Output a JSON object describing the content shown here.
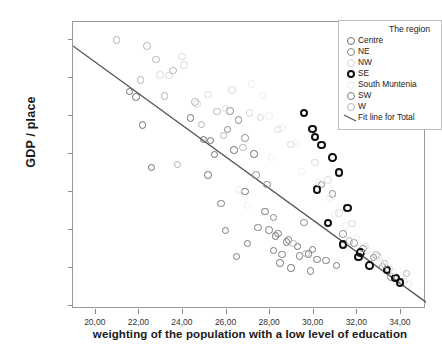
{
  "chart_data": {
    "type": "scatter",
    "title": "",
    "xlabel": "weighting of the population with a low level of education",
    "ylabel": "GDP / place",
    "xlim": [
      19.0,
      35.2
    ],
    "ylim": [
      900,
      8450
    ],
    "xticks": [
      "20,00",
      "22,00",
      "24,00",
      "26,00",
      "28,00",
      "30,00",
      "32,00",
      "34,00"
    ],
    "xtick_values": [
      20,
      22,
      24,
      26,
      28,
      30,
      32,
      34
    ],
    "yticks": [
      "1000,00",
      "2000,00",
      "3000,00",
      "4000,00",
      "5000,00",
      "6000,00",
      "7000,00",
      "8000,00"
    ],
    "ytick_values": [
      1000,
      2000,
      3000,
      4000,
      5000,
      6000,
      7000,
      8000
    ],
    "grid": false,
    "legend_position": "top-right",
    "legend_title": "The region",
    "fit_line": {
      "label": "Fit line for Total",
      "color": "#555555",
      "x_start": 19.0,
      "y_start": 7820,
      "x_end": 35.2,
      "y_end": 1080
    },
    "series": [
      {
        "name": "Centre",
        "color": "#6e6e6e",
        "marker": "open-circle",
        "points": [
          [
            21.6,
            6620
          ],
          [
            21.9,
            6480
          ],
          [
            22.2,
            5740
          ],
          [
            22.6,
            4620
          ],
          [
            24.4,
            5930
          ],
          [
            25.0,
            5360
          ],
          [
            25.3,
            5330
          ],
          [
            25.5,
            4960
          ],
          [
            25.2,
            4420
          ],
          [
            26.4,
            5080
          ],
          [
            27.3,
            4980
          ],
          [
            26.9,
            3990
          ],
          [
            27.8,
            3460
          ],
          [
            28.3,
            2820
          ],
          [
            28.8,
            2660
          ],
          [
            29.3,
            2540
          ],
          [
            29.8,
            2350
          ],
          [
            30.2,
            2200
          ],
          [
            28.5,
            2110
          ],
          [
            29.0,
            1980
          ]
        ]
      },
      {
        "name": "NE",
        "color": "#888888",
        "marker": "open-circle",
        "points": [
          [
            26.2,
            6110
          ],
          [
            26.6,
            5870
          ],
          [
            26.1,
            5620
          ],
          [
            26.9,
            5400
          ],
          [
            27.4,
            4420
          ],
          [
            27.9,
            4180
          ],
          [
            28.2,
            3310
          ],
          [
            29.6,
            3180
          ],
          [
            30.4,
            4170
          ],
          [
            30.9,
            3930
          ],
          [
            31.4,
            2870
          ],
          [
            31.9,
            2630
          ],
          [
            32.3,
            2490
          ],
          [
            32.8,
            2260
          ],
          [
            33.2,
            2010
          ],
          [
            33.6,
            1740
          ]
        ]
      },
      {
        "name": "NW",
        "color": "#d8d8d8",
        "marker": "open-circle",
        "points": [
          [
            24.0,
            7540
          ],
          [
            24.1,
            7320
          ],
          [
            23.0,
            7050
          ],
          [
            23.4,
            7040
          ],
          [
            25.2,
            6540
          ],
          [
            24.7,
            6290
          ],
          [
            26.3,
            6660
          ],
          [
            26.0,
            6170
          ],
          [
            27.1,
            6060
          ],
          [
            27.6,
            5940
          ],
          [
            28.4,
            5620
          ],
          [
            29.0,
            5230
          ],
          [
            30.1,
            4760
          ],
          [
            30.7,
            4300
          ],
          [
            31.2,
            3420
          ],
          [
            31.8,
            3150
          ],
          [
            32.4,
            2540
          ],
          [
            33.0,
            2270
          ],
          [
            33.5,
            1950
          ],
          [
            34.2,
            1620
          ]
        ]
      },
      {
        "name": "SE",
        "color": "#111111",
        "marker": "bold-open-circle",
        "points": [
          [
            29.6,
            6060
          ],
          [
            30.0,
            5640
          ],
          [
            30.1,
            5430
          ],
          [
            30.4,
            5210
          ],
          [
            30.9,
            4890
          ],
          [
            31.2,
            4490
          ],
          [
            30.2,
            4050
          ],
          [
            31.6,
            3560
          ],
          [
            30.7,
            3160
          ],
          [
            31.4,
            2600
          ],
          [
            32.2,
            2390
          ],
          [
            32.1,
            2270
          ],
          [
            32.6,
            2050
          ],
          [
            33.4,
            1920
          ],
          [
            33.8,
            1720
          ],
          [
            34.0,
            1600
          ]
        ]
      },
      {
        "name": "South Muntenia",
        "color": "#ededed",
        "marker": "open-circle",
        "points": [
          [
            27.2,
            6820
          ],
          [
            27.7,
            6520
          ],
          [
            28.0,
            5980
          ],
          [
            28.6,
            5660
          ],
          [
            29.2,
            5280
          ],
          [
            28.1,
            4880
          ],
          [
            29.5,
            4520
          ],
          [
            30.3,
            4230
          ],
          [
            30.8,
            3820
          ],
          [
            31.0,
            3400
          ],
          [
            31.5,
            3090
          ],
          [
            32.0,
            2760
          ],
          [
            32.5,
            2440
          ],
          [
            33.1,
            2150
          ],
          [
            33.7,
            1880
          ],
          [
            34.4,
            1560
          ],
          [
            26.6,
            4050
          ],
          [
            27.0,
            3620
          ]
        ]
      },
      {
        "name": "SW",
        "color": "#7a7a7a",
        "marker": "open-circle",
        "points": [
          [
            27.5,
            3050
          ],
          [
            28.0,
            2980
          ],
          [
            28.4,
            2880
          ],
          [
            27.0,
            2620
          ],
          [
            28.9,
            2720
          ],
          [
            28.2,
            2440
          ],
          [
            28.6,
            2330
          ],
          [
            29.4,
            2290
          ],
          [
            30.0,
            2470
          ],
          [
            30.6,
            2180
          ],
          [
            26.5,
            2280
          ],
          [
            29.9,
            1900
          ],
          [
            31.1,
            2040
          ],
          [
            26.0,
            2960
          ],
          [
            25.8,
            3680
          ]
        ]
      },
      {
        "name": "W",
        "color": "#b4b4b4",
        "marker": "open-circle",
        "points": [
          [
            21.0,
            7980
          ],
          [
            22.4,
            7820
          ],
          [
            22.8,
            7460
          ],
          [
            23.6,
            7180
          ],
          [
            22.1,
            6920
          ],
          [
            23.2,
            6500
          ],
          [
            24.6,
            6340
          ],
          [
            25.6,
            6090
          ],
          [
            24.9,
            5750
          ],
          [
            25.9,
            5470
          ],
          [
            26.8,
            5150
          ],
          [
            23.8,
            4700
          ],
          [
            29.1,
            2620
          ],
          [
            29.7,
            2360
          ],
          [
            31.7,
            2690
          ],
          [
            32.9,
            2320
          ],
          [
            33.3,
            2090
          ],
          [
            34.3,
            1840
          ]
        ]
      }
    ]
  },
  "legend": {
    "title": "The region",
    "entries": [
      {
        "label": "Centre",
        "kind": "marker",
        "color": "#6e6e6e",
        "weight": "1.4px"
      },
      {
        "label": "NE",
        "kind": "marker",
        "color": "#888888",
        "weight": "1.4px"
      },
      {
        "label": "NW",
        "kind": "marker",
        "color": "#d8d8d8",
        "weight": "1.4px"
      },
      {
        "label": "SE",
        "kind": "marker",
        "color": "#111111",
        "weight": "2.2px"
      },
      {
        "label": "South Muntenia",
        "kind": "marker",
        "color": "#ededed",
        "weight": "1.4px"
      },
      {
        "label": "SW",
        "kind": "marker",
        "color": "#7a7a7a",
        "weight": "1.4px"
      },
      {
        "label": "W",
        "kind": "marker",
        "color": "#b4b4b4",
        "weight": "1.4px"
      },
      {
        "label": "Fit line for Total",
        "kind": "line",
        "color": "#555555",
        "weight": "1px"
      }
    ]
  }
}
